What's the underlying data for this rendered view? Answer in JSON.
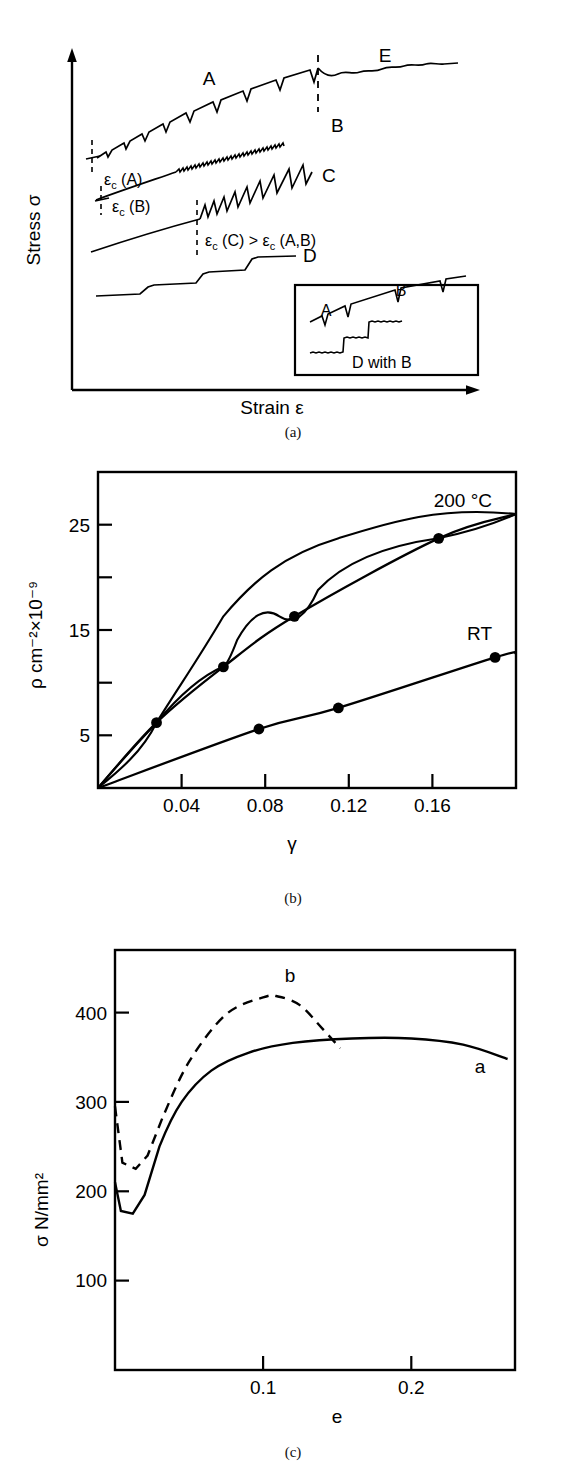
{
  "figure": {
    "panels": [
      {
        "id": "a",
        "caption": "(a)",
        "xlabel": "Strain ε",
        "ylabel": "Stress σ",
        "curve_labels": [
          "A",
          "B",
          "C",
          "D",
          "E"
        ],
        "annotations": [
          "εc (A)",
          "εc (B)",
          "εc (C) > εc (A,B)"
        ],
        "inset": {
          "labels": [
            "A",
            "B",
            "D with B"
          ]
        }
      },
      {
        "id": "b",
        "caption": "(b)",
        "xlabel": "γ",
        "ylabel": "ρ cm⁻²×10⁻⁹",
        "ytick_labels": [
          "5",
          "15",
          "25"
        ],
        "xtick_labels": [
          "0.04",
          "0.08",
          "0.12",
          "0.16"
        ],
        "series_labels": [
          "200 °C",
          "RT"
        ]
      },
      {
        "id": "c",
        "caption": "(c)",
        "xlabel": "e",
        "ylabel": "σ N/mm²",
        "ytick_labels": [
          "100",
          "200",
          "300",
          "400"
        ],
        "xtick_labels": [
          "0.1",
          "0.2"
        ],
        "curve_labels": [
          "a",
          "b"
        ]
      }
    ]
  },
  "chart_data": [
    {
      "type": "line",
      "panel": "a",
      "title": "",
      "xlabel": "Strain ε",
      "ylabel": "Stress σ",
      "grid": false,
      "legend": "inline-labels",
      "axis_ticks": false,
      "series": [
        {
          "name": "A",
          "description": "serrated flow curve, sparse large serrations, critical strain marked, transitions to E after dashed line",
          "critical_strain_label": "εc (A)"
        },
        {
          "name": "B",
          "description": "serrated flow curve, fine dense serrations",
          "critical_strain_label": "εc (B)"
        },
        {
          "name": "C",
          "description": "serrated flow curve, large sawtooth serrations beginning at higher critical strain",
          "critical_strain_label": "εc (C)"
        },
        {
          "name": "D",
          "description": "staircase / step-like flow curve"
        },
        {
          "name": "E",
          "description": "irregular wavy flow curve continuing from A"
        }
      ],
      "inset": {
        "series": [
          {
            "name": "A",
            "description": "rising line with small downward serration spikes, labels A and B"
          },
          {
            "name": "D with B",
            "description": "step curve with fine serrations on plateaus"
          }
        ]
      },
      "annotations": [
        "εc (C) > εc (A,B)"
      ]
    },
    {
      "type": "scatter",
      "panel": "b",
      "title": "",
      "xlabel": "γ",
      "ylabel": "ρ cm⁻²×10⁻⁹",
      "xlim": [
        0,
        0.2
      ],
      "ylim": [
        0,
        30
      ],
      "xticks": [
        0.04,
        0.08,
        0.12,
        0.16
      ],
      "yticks": [
        5,
        10,
        15,
        20,
        25
      ],
      "ytick_labeled": [
        5,
        15,
        25
      ],
      "grid": false,
      "series": [
        {
          "name": "200 °C",
          "x": [
            0.0,
            0.028,
            0.06,
            0.094,
            0.163,
            0.2
          ],
          "y": [
            0.0,
            6.2,
            11.5,
            16.3,
            23.7,
            26.0
          ],
          "markers_x": [
            0.028,
            0.06,
            0.094,
            0.163
          ],
          "markers_y": [
            6.2,
            11.5,
            16.3,
            23.7
          ],
          "marker": "filled-circle",
          "line": "solid"
        },
        {
          "name": "RT",
          "x": [
            0.0,
            0.077,
            0.115,
            0.19,
            0.2
          ],
          "y": [
            0.0,
            5.6,
            7.6,
            12.4,
            12.8
          ],
          "markers_x": [
            0.077,
            0.115,
            0.19
          ],
          "markers_y": [
            5.6,
            7.6,
            12.4
          ],
          "marker": "filled-circle",
          "line": "solid"
        }
      ]
    },
    {
      "type": "line",
      "panel": "c",
      "title": "",
      "xlabel": "e",
      "ylabel": "σ N/mm²",
      "xlim": [
        0,
        0.27
      ],
      "ylim": [
        0,
        470
      ],
      "xticks": [
        0.1,
        0.2
      ],
      "yticks": [
        100,
        200,
        300,
        400
      ],
      "grid": false,
      "series": [
        {
          "name": "a",
          "line": "solid",
          "description": "upper yield point ~210, lower yield plateau ~175, work hardening to plateau ~372, slight fall to ~348",
          "x": [
            0.0,
            0.004,
            0.012,
            0.02,
            0.03,
            0.045,
            0.065,
            0.09,
            0.12,
            0.16,
            0.2,
            0.235,
            0.265
          ],
          "y": [
            210,
            178,
            175,
            196,
            250,
            300,
            335,
            355,
            366,
            371,
            371,
            364,
            348
          ]
        },
        {
          "name": "b",
          "line": "dashed",
          "description": "upper yield point ~295, lower yield plateau ~225, rises to peak ~418 then falls, curve truncated",
          "x": [
            0.0,
            0.005,
            0.014,
            0.022,
            0.032,
            0.05,
            0.075,
            0.1,
            0.11,
            0.125,
            0.14,
            0.152
          ],
          "y": [
            295,
            232,
            225,
            240,
            282,
            345,
            398,
            417,
            418,
            408,
            382,
            360
          ]
        }
      ]
    }
  ]
}
